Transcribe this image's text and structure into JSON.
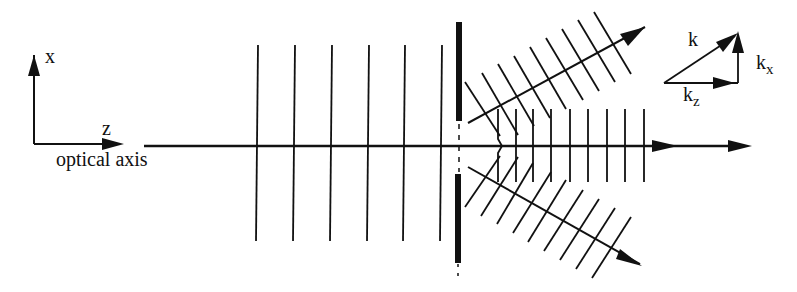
{
  "diagram": {
    "axes": {
      "x_label": "x",
      "z_label": "z",
      "axis_caption": "optical axis"
    },
    "vector_diagram": {
      "k_label": "k",
      "kx_label": "k",
      "kx_sub": "x",
      "kz_label": "k",
      "kz_sub": "z"
    },
    "incident_wavefronts": 6,
    "transmitted_wavefronts": 8,
    "diffracted_orders": [
      "+1 order (upward)",
      "0 order (on axis)",
      "-1 order (downward)"
    ],
    "colors": {
      "line": "#111111",
      "background": "#ffffff"
    }
  }
}
